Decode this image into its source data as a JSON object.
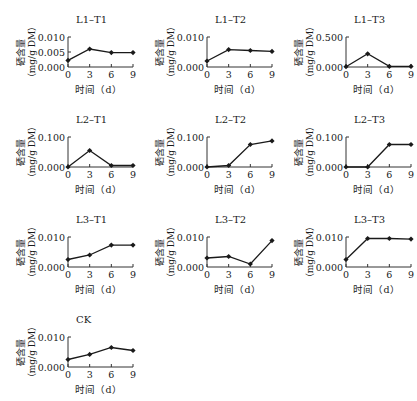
{
  "chart_data": [
    {
      "type": "line",
      "title": "L1–T1",
      "xlabel": "时间（d）",
      "ylabel": "硒含量（mg/g DM）",
      "x": [
        0,
        3,
        6,
        9
      ],
      "values": [
        0.0022,
        0.006,
        0.0048,
        0.0048
      ],
      "ylim": [
        0,
        0.01
      ],
      "yticks": [
        "0.000",
        "0.005",
        "0.010"
      ],
      "xticks": [
        "0",
        "3",
        "6",
        "9"
      ]
    },
    {
      "type": "line",
      "title": "L1–T2",
      "xlabel": "时间（d）",
      "ylabel": "硒含量（mg/g DM）",
      "x": [
        0,
        3,
        6,
        9
      ],
      "values": [
        0.002,
        0.0058,
        0.0055,
        0.0052
      ],
      "ylim": [
        0,
        0.01
      ],
      "yticks": [
        "0.000",
        "0.010"
      ],
      "xticks": [
        "0",
        "3",
        "6",
        "9"
      ]
    },
    {
      "type": "line",
      "title": "L1–T3",
      "xlabel": "时间（d）",
      "ylabel": "硒含量（mg/g DM）",
      "x": [
        0,
        3,
        6,
        9
      ],
      "values": [
        0.005,
        0.22,
        0.01,
        0.01
      ],
      "ylim": [
        0,
        0.5
      ],
      "yticks": [
        "0.000",
        "0.500"
      ],
      "xticks": [
        "0",
        "3",
        "6",
        "9"
      ]
    },
    {
      "type": "line",
      "title": "L2–T1",
      "xlabel": "时间（d）",
      "ylabel": "硒含量（mg/g DM）",
      "x": [
        0,
        3,
        6,
        9
      ],
      "values": [
        0.0,
        0.055,
        0.005,
        0.005
      ],
      "ylim": [
        0,
        0.1
      ],
      "yticks": [
        "0.000",
        "0.100"
      ],
      "xticks": [
        "0",
        "3",
        "6",
        "9"
      ]
    },
    {
      "type": "line",
      "title": "L2–T2",
      "xlabel": "时间（d）",
      "ylabel": "硒含量（mg/g DM）",
      "x": [
        0,
        3,
        6,
        9
      ],
      "values": [
        0.0,
        0.005,
        0.075,
        0.087
      ],
      "ylim": [
        0,
        0.1
      ],
      "yticks": [
        "0.000",
        "0.100"
      ],
      "xticks": [
        "0",
        "3",
        "6",
        "9"
      ]
    },
    {
      "type": "line",
      "title": "L2–T3",
      "xlabel": "时间（d）",
      "ylabel": "硒含量（mg/g DM）",
      "x": [
        0,
        3,
        6,
        9
      ],
      "values": [
        0.0,
        0.0,
        0.075,
        0.075
      ],
      "ylim": [
        0,
        0.1
      ],
      "yticks": [
        "0.000",
        "0.100"
      ],
      "xticks": [
        "0",
        "3",
        "6",
        "9"
      ]
    },
    {
      "type": "line",
      "title": "L3–T1",
      "xlabel": "时间（d）",
      "ylabel": "硒含量（mg/g DM）",
      "x": [
        0,
        3,
        6,
        9
      ],
      "values": [
        0.0025,
        0.004,
        0.0073,
        0.0073
      ],
      "ylim": [
        0,
        0.01
      ],
      "yticks": [
        "0.000",
        "0.010"
      ],
      "xticks": [
        "0",
        "3",
        "6",
        "9"
      ]
    },
    {
      "type": "line",
      "title": "L3–T2",
      "xlabel": "时间（d）",
      "ylabel": "硒含量（mg/g DM）",
      "x": [
        0,
        3,
        6,
        9
      ],
      "values": [
        0.003,
        0.0035,
        0.001,
        0.0088
      ],
      "ylim": [
        0,
        0.01
      ],
      "yticks": [
        "0.000",
        "0.010"
      ],
      "xticks": [
        "0",
        "3",
        "6",
        "9"
      ]
    },
    {
      "type": "line",
      "title": "L3–T3",
      "xlabel": "时间（d）",
      "ylabel": "硒含量（mg/g DM）",
      "x": [
        0,
        3,
        6,
        9
      ],
      "values": [
        0.0025,
        0.0095,
        0.0095,
        0.0093
      ],
      "ylim": [
        0,
        0.01
      ],
      "yticks": [
        "0.000",
        "0.010"
      ],
      "xticks": [
        "0",
        "3",
        "6",
        "9"
      ]
    },
    {
      "type": "line",
      "title": "CK",
      "xlabel": "时间（d）",
      "ylabel": "硒含量（mg/g DM）",
      "x": [
        0,
        3,
        6,
        9
      ],
      "values": [
        0.0025,
        0.0042,
        0.0065,
        0.0055
      ],
      "ylim": [
        0,
        0.01
      ],
      "yticks": [
        "0.000",
        "0.010"
      ],
      "xticks": [
        "0",
        "3",
        "6",
        "9"
      ]
    }
  ],
  "layout": {
    "positions": [
      [
        0,
        0
      ],
      [
        139,
        0
      ],
      [
        278,
        0
      ],
      [
        0,
        100
      ],
      [
        139,
        100
      ],
      [
        278,
        100
      ],
      [
        0,
        200
      ],
      [
        139,
        200
      ],
      [
        278,
        200
      ],
      [
        0,
        300
      ]
    ]
  },
  "colors": {
    "line": "#1a1a1a",
    "axis": "#333333"
  }
}
